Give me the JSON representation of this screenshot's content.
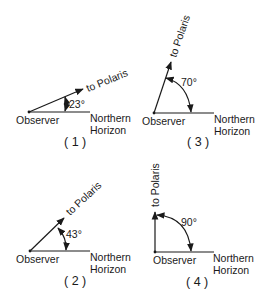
{
  "diagram": {
    "labels": {
      "observer": "Observer",
      "horizon_line1": "Northern",
      "horizon_line2": "Horizon",
      "polaris": "to Polaris"
    },
    "panels": [
      {
        "number": "( 1 )",
        "angle_deg": 23,
        "angle_label": "23°"
      },
      {
        "number": "( 2 )",
        "angle_deg": 43,
        "angle_label": "43°"
      },
      {
        "number": "( 3 )",
        "angle_deg": 70,
        "angle_label": "70°"
      },
      {
        "number": "( 4 )",
        "angle_deg": 90,
        "angle_label": "90°"
      }
    ],
    "colors": {
      "ink": "#1a1a1a",
      "background": "#ffffff"
    }
  }
}
